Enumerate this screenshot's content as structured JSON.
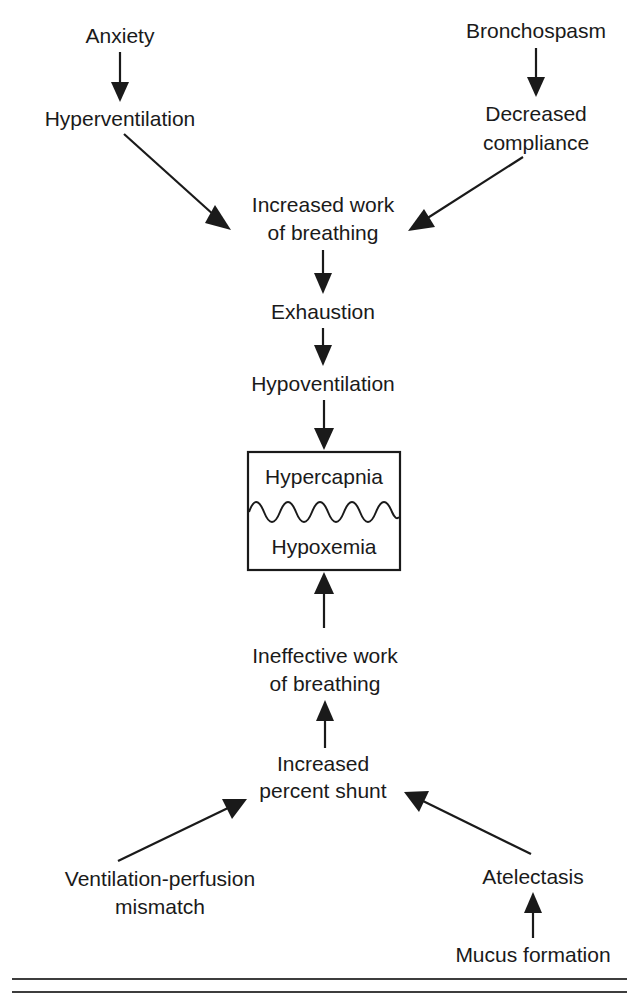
{
  "diagram": {
    "colors": {
      "ink": "#1a1a1a",
      "background": "#ffffff",
      "rule": "#3d3d3d"
    },
    "nodes": {
      "anxiety": {
        "label": "Anxiety",
        "x": 120,
        "y": 37
      },
      "bronchospasm": {
        "label": "Bronchospasm",
        "x": 536,
        "y": 32
      },
      "hyperventilation": {
        "label": "Hyperventilation",
        "x": 120,
        "y": 120
      },
      "decreased_compliance_line1": {
        "label": "Decreased",
        "x": 536,
        "y": 115
      },
      "decreased_compliance_line2": {
        "label": "compliance",
        "x": 536,
        "y": 144
      },
      "increased_work_line1": {
        "label": "Increased work",
        "x": 323,
        "y": 206
      },
      "increased_work_line2": {
        "label": "of breathing",
        "x": 323,
        "y": 234
      },
      "exhaustion": {
        "label": "Exhaustion",
        "x": 323,
        "y": 313
      },
      "hypoventilation": {
        "label": "Hypoventilation",
        "x": 323,
        "y": 385
      },
      "hypercapnia": {
        "label": "Hypercapnia",
        "x": 324,
        "y": 478
      },
      "hypoxemia": {
        "label": "Hypoxemia",
        "x": 324,
        "y": 548
      },
      "ineffective_work_line1": {
        "label": "Ineffective work",
        "x": 325,
        "y": 657
      },
      "ineffective_work_line2": {
        "label": "of breathing",
        "x": 325,
        "y": 685
      },
      "increased_shunt_line1": {
        "label": "Increased",
        "x": 323,
        "y": 765
      },
      "increased_shunt_line2": {
        "label": "percent shunt",
        "x": 323,
        "y": 792
      },
      "vq_mismatch_line1": {
        "label": "Ventilation-perfusion",
        "x": 160,
        "y": 880
      },
      "vq_mismatch_line2": {
        "label": "mismatch",
        "x": 160,
        "y": 908
      },
      "atelectasis": {
        "label": "Atelectasis",
        "x": 533,
        "y": 878
      },
      "mucus_formation": {
        "label": "Mucus formation",
        "x": 533,
        "y": 956
      }
    },
    "state_box": {
      "x": 248,
      "y": 452,
      "width": 152,
      "height": 118,
      "top_label": "Hypercapnia",
      "bottom_label": "Hypoxemia"
    },
    "edges": [
      {
        "name": "anxiety-to-hyperventilation",
        "from": "Anxiety",
        "to": "Hyperventilation"
      },
      {
        "name": "bronchospasm-to-decreased-compliance",
        "from": "Bronchospasm",
        "to": "Decreased compliance"
      },
      {
        "name": "hyperventilation-to-increased-work",
        "from": "Hyperventilation",
        "to": "Increased work of breathing"
      },
      {
        "name": "decreased-compliance-to-increased-work",
        "from": "Decreased compliance",
        "to": "Increased work of breathing"
      },
      {
        "name": "increased-work-to-exhaustion",
        "from": "Increased work of breathing",
        "to": "Exhaustion"
      },
      {
        "name": "exhaustion-to-hypoventilation",
        "from": "Exhaustion",
        "to": "Hypoventilation"
      },
      {
        "name": "hypoventilation-to-state-box",
        "from": "Hypoventilation",
        "to": "Hypercapnia / Hypoxemia"
      },
      {
        "name": "ineffective-work-to-state-box",
        "from": "Ineffective work of breathing",
        "to": "Hypercapnia / Hypoxemia"
      },
      {
        "name": "increased-shunt-to-ineffective-work",
        "from": "Increased percent shunt",
        "to": "Ineffective work of breathing"
      },
      {
        "name": "vq-mismatch-to-increased-shunt",
        "from": "Ventilation-perfusion mismatch",
        "to": "Increased percent shunt"
      },
      {
        "name": "atelectasis-to-increased-shunt",
        "from": "Atelectasis",
        "to": "Increased percent shunt"
      },
      {
        "name": "mucus-formation-to-atelectasis",
        "from": "Mucus formation",
        "to": "Atelectasis"
      }
    ],
    "footer_rules": [
      {
        "name": "footer-rule-top",
        "y": 979
      },
      {
        "name": "footer-rule-bottom",
        "y": 992
      }
    ]
  }
}
